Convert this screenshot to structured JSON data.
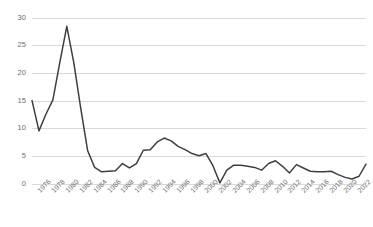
{
  "chart_data": {
    "type": "line",
    "title": "",
    "subtitle": "",
    "xlabel": "",
    "ylabel": "",
    "grid": true,
    "legend": false,
    "legend_position": "none",
    "line_color": "#3f3f3f",
    "grid_color": "#d0d0d0",
    "tick_label_color": "#6e6e6e",
    "ylim": [
      0,
      30
    ],
    "yticks": [
      0,
      5,
      10,
      15,
      20,
      25,
      30
    ],
    "ytick_labels": [
      "0",
      "5",
      "10",
      "15",
      "20",
      "25",
      "30"
    ],
    "xlim": [
      1975,
      2023
    ],
    "xtick_labels": [
      "1976",
      "1978",
      "1980",
      "1982",
      "1984",
      "1986",
      "1988",
      "1990",
      "1992",
      "1994",
      "1996",
      "1998",
      "2000",
      "2002",
      "2004",
      "2006",
      "2008",
      "2010",
      "2012",
      "2014",
      "2016",
      "2018",
      "2020",
      "2022"
    ],
    "xticks": [
      1976,
      1978,
      1980,
      1982,
      1984,
      1986,
      1988,
      1990,
      1992,
      1994,
      1996,
      1998,
      2000,
      2002,
      2004,
      2006,
      2008,
      2010,
      2012,
      2014,
      2016,
      2018,
      2020,
      2022
    ],
    "x": [
      1975,
      1976,
      1977,
      1978,
      1979,
      1980,
      1981,
      1982,
      1983,
      1984,
      1985,
      1986,
      1987,
      1988,
      1989,
      1990,
      1991,
      1992,
      1993,
      1994,
      1995,
      1996,
      1997,
      1998,
      1999,
      2000,
      2001,
      2002,
      2003,
      2004,
      2005,
      2006,
      2007,
      2008,
      2009,
      2010,
      2011,
      2012,
      2013,
      2014,
      2015,
      2016,
      2017,
      2018,
      2019,
      2020,
      2021,
      2022,
      2023
    ],
    "values": [
      15.1,
      9.6,
      12.6,
      15.2,
      22.0,
      28.5,
      22.0,
      13.7,
      6.0,
      3.0,
      2.2,
      2.3,
      2.4,
      3.7,
      2.9,
      3.7,
      6.1,
      6.2,
      7.6,
      8.3,
      7.8,
      6.8,
      6.2,
      5.5,
      5.1,
      5.5,
      3.3,
      0.2,
      2.5,
      3.4,
      3.4,
      3.2,
      3.0,
      2.5,
      3.7,
      4.2,
      3.2,
      2.0,
      3.5,
      2.9,
      2.3,
      2.2,
      2.2,
      2.3,
      1.7,
      1.2,
      0.9,
      1.4,
      3.6
    ],
    "series": [
      {
        "name": "series-1",
        "values": [
          15.1,
          9.6,
          12.6,
          15.2,
          22.0,
          28.5,
          22.0,
          13.7,
          6.0,
          3.0,
          2.2,
          2.3,
          2.4,
          3.7,
          2.9,
          3.7,
          6.1,
          6.2,
          7.6,
          8.3,
          7.8,
          6.8,
          6.2,
          5.5,
          5.1,
          5.5,
          3.3,
          0.2,
          2.5,
          3.4,
          3.4,
          3.2,
          3.0,
          2.5,
          3.7,
          4.2,
          3.2,
          2.0,
          3.5,
          2.9,
          2.3,
          2.2,
          2.2,
          2.3,
          1.7,
          1.2,
          0.9,
          1.4,
          3.6
        ]
      }
    ],
    "annotations": []
  },
  "plot_geometry": {
    "left": 32,
    "right": 366,
    "top": 18,
    "bottom": 184
  }
}
